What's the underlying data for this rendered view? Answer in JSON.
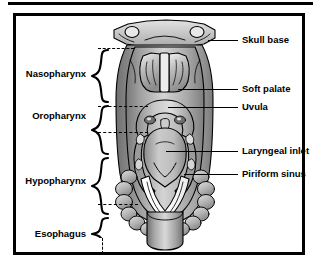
{
  "figure": {
    "type": "anatomical-diagram",
    "view": "posterior",
    "palette": {
      "ink": "#000000",
      "paper": "#ffffff",
      "tissue_light": "#d8d8d8",
      "tissue_mid": "#a8a8a8",
      "tissue_dark": "#7a7a7a",
      "bone": "#c9c9c9",
      "shadow": "#5a5a5a",
      "highlight": "#f0f0f0"
    }
  },
  "regions": [
    {
      "id": "nasopharynx",
      "label": "Nasopharynx",
      "y": 58
    },
    {
      "id": "oropharynx",
      "label": "Oropharynx",
      "y": 100
    },
    {
      "id": "hypopharynx",
      "label": "Hypopharynx",
      "y": 165
    },
    {
      "id": "esophagus",
      "label": "Esophagus",
      "y": 218
    }
  ],
  "callouts": [
    {
      "id": "skull-base",
      "label": "Skull base",
      "y": 29
    },
    {
      "id": "soft-palate",
      "label": "Soft palate",
      "y": 78
    },
    {
      "id": "uvula",
      "label": "Uvula",
      "y": 96
    },
    {
      "id": "laryngeal-inlet",
      "label": "Laryngeal inlet",
      "y": 140
    },
    {
      "id": "piriform-sinus",
      "label": "Piriform sinus",
      "y": 163
    }
  ]
}
